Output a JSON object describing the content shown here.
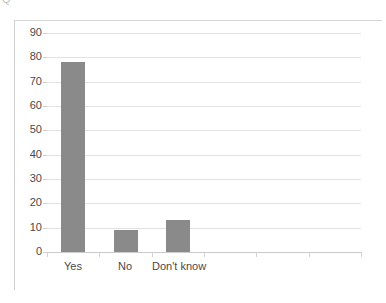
{
  "clipped_title": "Q",
  "chart_data": {
    "type": "bar",
    "title": "",
    "subtitle": "",
    "xlabel": "",
    "ylabel": "",
    "categories": [
      "Yes",
      "No",
      "Don't know"
    ],
    "values": [
      78,
      9,
      13
    ],
    "series": [
      {
        "name": "Percent",
        "values": [
          78,
          9,
          13
        ]
      }
    ],
    "ylim": [
      0,
      90
    ],
    "ytick_labels": [
      "0",
      "10",
      "20",
      "30",
      "40",
      "50",
      "60",
      "70",
      "80",
      "90"
    ],
    "ytick_values": [
      0,
      10,
      20,
      30,
      40,
      50,
      60,
      70,
      80,
      90
    ],
    "grid": true,
    "legend": false,
    "legend_position": "none",
    "bar_color": "#8a8a8a",
    "gridline_color": "#e2e2e2",
    "axis_color": "#cbcbcb",
    "empty_category_slots": 3,
    "total_category_slots": 6,
    "annotations": []
  }
}
